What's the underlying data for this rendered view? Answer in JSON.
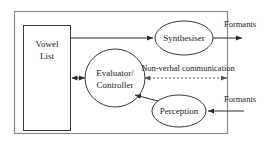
{
  "diagram": {
    "colors": {
      "shape_stroke": "#3a3a3a",
      "frame_stroke": "#8a8a8a",
      "edge_stroke": "#2a2a2a",
      "dashed_stroke": "#555555",
      "text": "#1a1a1a",
      "background": "#ffffff"
    },
    "frame": {
      "name": "agent-boundary",
      "x": 14,
      "y": 11,
      "width": 214,
      "height": 123
    },
    "nodes": [
      {
        "id": "vowel-list",
        "shape": "rect",
        "lines": [
          "Vowel",
          "List"
        ],
        "x": 23,
        "y": 25,
        "width": 48,
        "height": 106
      },
      {
        "id": "synthesiser",
        "shape": "ellipse",
        "lines": [
          "Synthesiser"
        ],
        "cx": 184,
        "cy": 38,
        "rx": 29,
        "ry": 17
      },
      {
        "id": "evaluator-controller",
        "shape": "ellipse",
        "lines": [
          "Evaluator/",
          "Controller"
        ],
        "cx": 115,
        "cy": 78,
        "rx": 30,
        "ry": 29
      },
      {
        "id": "perception",
        "shape": "ellipse",
        "lines": [
          "Perception"
        ],
        "cx": 179,
        "cy": 111,
        "rx": 27,
        "ry": 16
      }
    ],
    "edges": [
      {
        "id": "vowel-list-to-synthesiser",
        "from": "vowel-list",
        "to": "synthesiser",
        "style": "solid",
        "arrows": "end"
      },
      {
        "id": "vowel-list-evaluator",
        "from": "vowel-list",
        "to": "evaluator-controller",
        "style": "solid",
        "arrows": "both"
      },
      {
        "id": "synthesiser-to-formants-out",
        "from": "synthesiser",
        "to": "formants-output",
        "style": "solid",
        "arrows": "end"
      },
      {
        "id": "formants-in-to-perception",
        "from": "formants-input",
        "to": "perception",
        "style": "solid",
        "arrows": "end"
      },
      {
        "id": "perception-to-evaluator",
        "from": "perception",
        "to": "evaluator-controller",
        "style": "solid",
        "arrows": "end"
      },
      {
        "id": "non-verbal-communication-channel",
        "from": "evaluator-controller",
        "to": "external",
        "style": "dashed",
        "arrows": "both",
        "label": "Non-verbal communication"
      }
    ],
    "labels": {
      "formants_out": "Formants",
      "formants_in": "Formants",
      "non_verbal": "Non-verbal communication"
    }
  }
}
